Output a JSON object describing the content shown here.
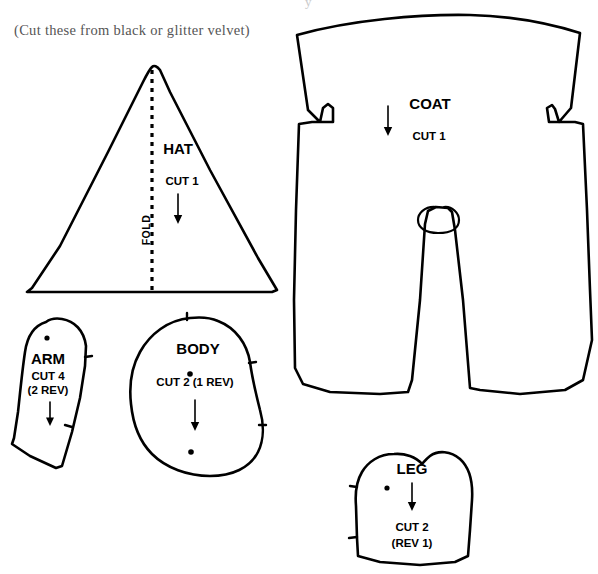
{
  "sheet": {
    "caption": "(Cut these from black or glitter velvet)",
    "background_color": "#ffffff",
    "ink_color": "#000000",
    "caption_color": "#555555"
  },
  "pieces": [
    {
      "id": "hat",
      "name": "HAT",
      "cut_line_1": "CUT 1",
      "fold_label": "FOLD",
      "has_fold_line": true,
      "has_grain_arrow": true,
      "dots": 0,
      "notches": 0
    },
    {
      "id": "coat",
      "name": "COAT",
      "cut_line_1": "CUT 1",
      "fold_label": "",
      "has_fold_line": false,
      "has_grain_arrow": true,
      "dots": 0,
      "notches": 0
    },
    {
      "id": "arm",
      "name": "ARM",
      "cut_line_1": "CUT 4",
      "cut_line_2": "(2 REV)",
      "has_fold_line": false,
      "has_grain_arrow": true,
      "dots": 1,
      "notches": 2
    },
    {
      "id": "body",
      "name": "BODY",
      "cut_line_1": "CUT 2 (1 REV)",
      "has_fold_line": false,
      "has_grain_arrow": true,
      "dots": 2,
      "notches": 3
    },
    {
      "id": "leg",
      "name": "LEG",
      "cut_line_1": "CUT 2",
      "cut_line_2": "(REV 1)",
      "has_fold_line": false,
      "has_grain_arrow": true,
      "dots": 1,
      "notches": 2
    }
  ]
}
